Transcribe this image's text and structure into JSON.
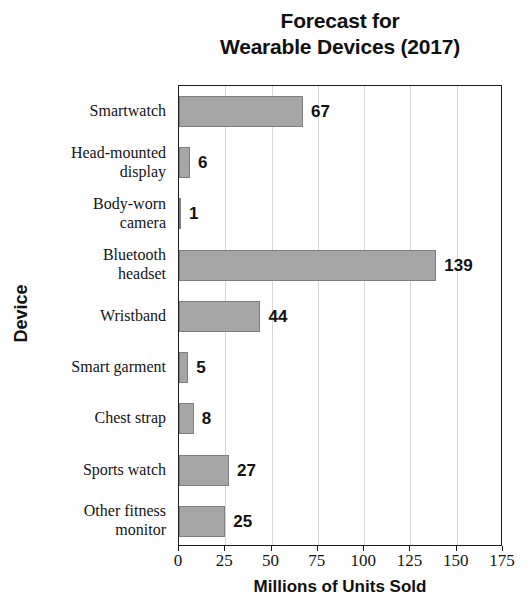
{
  "chart_data": {
    "type": "bar",
    "orientation": "horizontal",
    "title": "Forecast for Wearable Devices (2017)",
    "title_lines": [
      "Forecast for",
      "Wearable Devices (2017)"
    ],
    "xlabel": "Millions of Units Sold",
    "ylabel": "Device",
    "categories": [
      "Smartwatch",
      "Head-mounted display",
      "Body-worn camera",
      "Bluetooth headset",
      "Wristband",
      "Smart garment",
      "Chest strap",
      "Sports watch",
      "Other fitness monitor"
    ],
    "category_lines": [
      [
        "Smartwatch"
      ],
      [
        "Head-mounted",
        "display"
      ],
      [
        "Body-worn",
        "camera"
      ],
      [
        "Bluetooth",
        "headset"
      ],
      [
        "Wristband"
      ],
      [
        "Smart garment"
      ],
      [
        "Chest strap"
      ],
      [
        "Sports watch"
      ],
      [
        "Other fitness",
        "monitor"
      ]
    ],
    "values": [
      67,
      6,
      1,
      139,
      44,
      5,
      8,
      27,
      25
    ],
    "value_labels": [
      "67",
      "6",
      "1",
      "139",
      "44",
      "5",
      "8",
      "27",
      "25"
    ],
    "xlim": [
      0,
      175
    ],
    "xticks": [
      0,
      25,
      50,
      75,
      100,
      125,
      150,
      175
    ],
    "xtick_labels": [
      "0",
      "25",
      "50",
      "75",
      "100",
      "125",
      "150",
      "175"
    ],
    "grid": "vertical",
    "legend": "none",
    "bar_fill_color": "#a6a6a6",
    "bar_edge_color": "#7e7e7e",
    "gridline_color": "#d6d6d6",
    "axis_color": "#1c1c1c",
    "background_color": "#fefefe"
  }
}
